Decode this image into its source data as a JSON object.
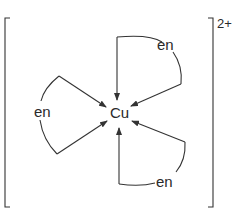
{
  "diagram": {
    "type": "coordination-complex",
    "metal": "Cu",
    "charge": "2+",
    "ligands": [
      {
        "label": "en",
        "position": "top-right"
      },
      {
        "label": "en",
        "position": "left"
      },
      {
        "label": "en",
        "position": "bottom-right"
      }
    ]
  },
  "colors": {
    "line": "#333333",
    "text": "#2a2a2a",
    "background": "#ffffff"
  }
}
